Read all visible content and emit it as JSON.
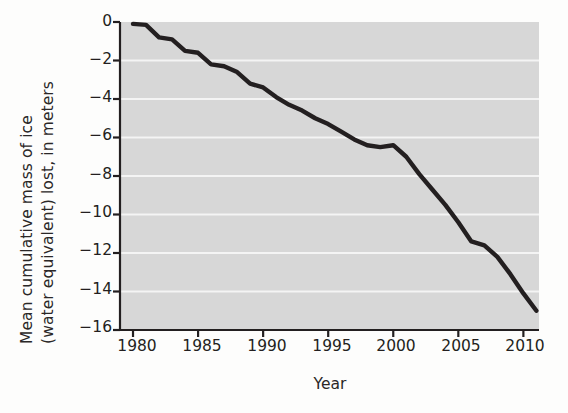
{
  "chart_data": {
    "type": "line",
    "title": "",
    "xlabel": "Year",
    "ylabel": "Mean cumulative mass of ice (water equivalent) lost, in meters",
    "ylabel_lines": [
      "Mean cumulative mass of ice",
      "(water equivalent) lost, in meters"
    ],
    "xlim": [
      1979.0,
      1981.2
    ],
    "x_axis_range": [
      1979.0,
      2011.2
    ],
    "ylim": [
      -16,
      0
    ],
    "xticks": [
      1980,
      1985,
      1990,
      1995,
      2000,
      2005,
      2010
    ],
    "xtick_labels": [
      "1980",
      "1985",
      "1990",
      "1995",
      "2000",
      "2005",
      "2010"
    ],
    "yticks": [
      0,
      -2,
      -4,
      -6,
      -8,
      -10,
      -12,
      -14,
      -16
    ],
    "ytick_labels": [
      "0",
      "−2",
      "−4",
      "−6",
      "−8",
      "−10",
      "−12",
      "−14",
      "−16"
    ],
    "grid": "horizontal-white-gridlines",
    "legend": "none",
    "plot_background": "#d7d7d7",
    "gridline_color": "#f4f4f4",
    "line_color": "#231f20",
    "line_width": 4.4,
    "x": [
      1980,
      1981,
      1982,
      1983,
      1984,
      1985,
      1986,
      1987,
      1988,
      1989,
      1990,
      1991,
      1992,
      1993,
      1994,
      1995,
      1996,
      1997,
      1998,
      1999,
      2000,
      2001,
      2002,
      2003,
      2004,
      2005,
      2006,
      2007,
      2008,
      2009,
      2010,
      2011
    ],
    "values": [
      -0.1,
      -0.15,
      -0.8,
      -0.9,
      -1.5,
      -1.6,
      -2.2,
      -2.3,
      -2.6,
      -3.2,
      -3.4,
      -3.9,
      -4.3,
      -4.6,
      -5.0,
      -5.3,
      -5.7,
      -6.1,
      -6.4,
      -6.5,
      -6.4,
      -7.0,
      -7.9,
      -8.7,
      -9.5,
      -10.4,
      -11.4,
      -11.6,
      -12.2,
      -13.1,
      -14.1,
      -15.0
    ],
    "series": [
      {
        "name": "Mean cumulative mass of ice lost",
        "values": [
          -0.1,
          -0.15,
          -0.8,
          -0.9,
          -1.5,
          -1.6,
          -2.2,
          -2.3,
          -2.6,
          -3.2,
          -3.4,
          -3.9,
          -4.3,
          -4.6,
          -5.0,
          -5.3,
          -5.7,
          -6.1,
          -6.4,
          -6.5,
          -6.4,
          -7.0,
          -7.9,
          -8.7,
          -9.5,
          -10.4,
          -11.4,
          -11.6,
          -12.2,
          -13.1,
          -14.1,
          -15.0
        ]
      }
    ]
  },
  "geometry": {
    "plot_left": 120,
    "plot_right": 539,
    "plot_top": 22,
    "plot_bottom": 330
  }
}
